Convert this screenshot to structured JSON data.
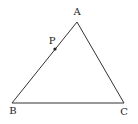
{
  "diagram": {
    "type": "geometry-triangle",
    "stroke_color": "#333333",
    "points": {
      "A": {
        "label": "A",
        "x": 77,
        "y": 22,
        "label_x": 77,
        "label_y": 15
      },
      "B": {
        "label": "B",
        "x": 12,
        "y": 103,
        "label_x": 13,
        "label_y": 114
      },
      "C": {
        "label": "C",
        "x": 124,
        "y": 103,
        "label_x": 124,
        "label_y": 115
      },
      "P": {
        "label": "P",
        "x": 55,
        "y": 49,
        "label_x": 52,
        "label_y": 44
      }
    },
    "segments": [
      {
        "from": "A",
        "to": "B"
      },
      {
        "from": "B",
        "to": "C"
      },
      {
        "from": "C",
        "to": "A"
      }
    ],
    "marked_point": {
      "name": "P",
      "on_segment": "AB"
    }
  }
}
